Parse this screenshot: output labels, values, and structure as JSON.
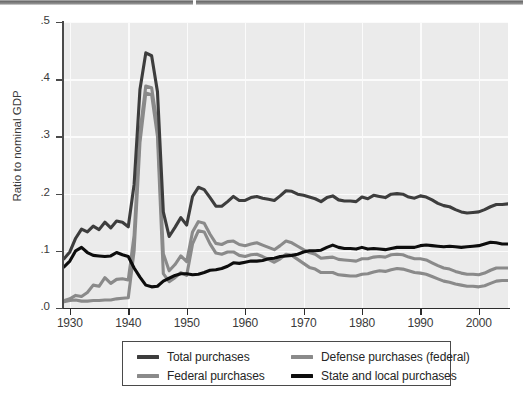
{
  "chart_data": {
    "type": "line",
    "title": "",
    "xlabel": "",
    "ylabel": "Ratio to nominal GDP",
    "xlim": [
      1929,
      2005
    ],
    "ylim": [
      0.0,
      0.5
    ],
    "grid": true,
    "legend_position": "below-plot",
    "xticklabels": [
      "1930",
      "1940",
      "1950",
      "1960",
      "1970",
      "1980",
      "1990",
      "2000"
    ],
    "xtickvalues": [
      1930,
      1940,
      1950,
      1960,
      1970,
      1980,
      1990,
      2000
    ],
    "yticklabels": [
      ".0",
      ".1",
      ".2",
      ".3",
      ".4",
      ".5"
    ],
    "ytickvalues": [
      0.0,
      0.1,
      0.2,
      0.3,
      0.4,
      0.5
    ],
    "x": [
      1929,
      1930,
      1931,
      1932,
      1933,
      1934,
      1935,
      1936,
      1937,
      1938,
      1939,
      1940,
      1941,
      1942,
      1943,
      1944,
      1945,
      1946,
      1947,
      1948,
      1949,
      1950,
      1951,
      1952,
      1953,
      1954,
      1955,
      1956,
      1957,
      1958,
      1959,
      1960,
      1961,
      1962,
      1963,
      1964,
      1965,
      1966,
      1967,
      1968,
      1969,
      1970,
      1971,
      1972,
      1973,
      1974,
      1975,
      1976,
      1977,
      1978,
      1979,
      1980,
      1981,
      1982,
      1983,
      1984,
      1985,
      1986,
      1987,
      1988,
      1989,
      1990,
      1991,
      1992,
      1993,
      1994,
      1995,
      1996,
      1997,
      1998,
      1999,
      2000,
      2001,
      2002,
      2003,
      2004,
      2005
    ],
    "series": [
      {
        "name": "Total purchases",
        "color": "#3d3d3d",
        "values": [
          0.086,
          0.098,
          0.122,
          0.138,
          0.133,
          0.143,
          0.137,
          0.15,
          0.14,
          0.152,
          0.15,
          0.142,
          0.216,
          0.382,
          0.446,
          0.441,
          0.378,
          0.168,
          0.125,
          0.141,
          0.158,
          0.145,
          0.195,
          0.211,
          0.207,
          0.193,
          0.178,
          0.178,
          0.186,
          0.195,
          0.188,
          0.188,
          0.193,
          0.195,
          0.192,
          0.19,
          0.188,
          0.196,
          0.205,
          0.204,
          0.199,
          0.197,
          0.194,
          0.191,
          0.186,
          0.193,
          0.196,
          0.189,
          0.187,
          0.187,
          0.186,
          0.194,
          0.191,
          0.197,
          0.195,
          0.193,
          0.199,
          0.2,
          0.199,
          0.194,
          0.192,
          0.196,
          0.194,
          0.189,
          0.183,
          0.179,
          0.177,
          0.172,
          0.168,
          0.166,
          0.167,
          0.168,
          0.172,
          0.177,
          0.181,
          0.181,
          0.182
        ]
      },
      {
        "name": "Federal purchases",
        "color": "#8a8a8a",
        "values": [
          0.013,
          0.016,
          0.022,
          0.02,
          0.027,
          0.04,
          0.038,
          0.053,
          0.043,
          0.05,
          0.051,
          0.049,
          0.127,
          0.308,
          0.388,
          0.385,
          0.318,
          0.095,
          0.065,
          0.076,
          0.091,
          0.081,
          0.133,
          0.151,
          0.148,
          0.129,
          0.113,
          0.111,
          0.116,
          0.117,
          0.111,
          0.109,
          0.112,
          0.114,
          0.11,
          0.106,
          0.102,
          0.109,
          0.117,
          0.114,
          0.108,
          0.102,
          0.097,
          0.094,
          0.087,
          0.088,
          0.089,
          0.085,
          0.084,
          0.083,
          0.082,
          0.086,
          0.086,
          0.089,
          0.09,
          0.089,
          0.093,
          0.094,
          0.093,
          0.089,
          0.086,
          0.086,
          0.084,
          0.079,
          0.074,
          0.07,
          0.068,
          0.064,
          0.061,
          0.059,
          0.059,
          0.058,
          0.061,
          0.066,
          0.07,
          0.07,
          0.07
        ]
      },
      {
        "name": "Defense purchases (federal)",
        "color": "#8a8a8a",
        "values": [
          0.011,
          0.013,
          0.014,
          0.012,
          0.012,
          0.013,
          0.013,
          0.014,
          0.014,
          0.016,
          0.017,
          0.018,
          0.1,
          0.289,
          0.376,
          0.373,
          0.3,
          0.06,
          0.046,
          0.053,
          0.062,
          0.057,
          0.112,
          0.135,
          0.133,
          0.112,
          0.096,
          0.094,
          0.098,
          0.098,
          0.092,
          0.09,
          0.093,
          0.094,
          0.09,
          0.085,
          0.08,
          0.086,
          0.094,
          0.092,
          0.085,
          0.078,
          0.071,
          0.068,
          0.062,
          0.062,
          0.062,
          0.058,
          0.057,
          0.056,
          0.056,
          0.059,
          0.06,
          0.063,
          0.065,
          0.064,
          0.067,
          0.069,
          0.068,
          0.065,
          0.062,
          0.061,
          0.059,
          0.055,
          0.051,
          0.047,
          0.045,
          0.042,
          0.04,
          0.038,
          0.038,
          0.037,
          0.039,
          0.043,
          0.047,
          0.048,
          0.048
        ]
      },
      {
        "name": "State and local purchases",
        "color": "#0d0d0d",
        "values": [
          0.072,
          0.082,
          0.1,
          0.106,
          0.097,
          0.092,
          0.091,
          0.09,
          0.091,
          0.097,
          0.093,
          0.09,
          0.07,
          0.054,
          0.04,
          0.037,
          0.038,
          0.047,
          0.052,
          0.057,
          0.06,
          0.06,
          0.058,
          0.059,
          0.062,
          0.066,
          0.067,
          0.069,
          0.073,
          0.079,
          0.078,
          0.08,
          0.082,
          0.082,
          0.083,
          0.086,
          0.087,
          0.09,
          0.091,
          0.092,
          0.094,
          0.098,
          0.1,
          0.1,
          0.101,
          0.106,
          0.11,
          0.106,
          0.104,
          0.104,
          0.103,
          0.106,
          0.103,
          0.104,
          0.103,
          0.102,
          0.104,
          0.106,
          0.106,
          0.106,
          0.106,
          0.109,
          0.11,
          0.109,
          0.108,
          0.107,
          0.108,
          0.107,
          0.106,
          0.107,
          0.108,
          0.109,
          0.112,
          0.115,
          0.114,
          0.112,
          0.112
        ]
      }
    ]
  },
  "axis": {
    "ylabel": "Ratio to nominal GDP"
  },
  "legend": {
    "entries": [
      {
        "label": "Total purchases",
        "color": "#3d3d3d"
      },
      {
        "label": "Defense purchases (federal)",
        "color": "#8a8a8a"
      },
      {
        "label": "Federal purchases",
        "color": "#8a8a8a"
      },
      {
        "label": "State and local purchases",
        "color": "#0d0d0d"
      }
    ]
  },
  "artifacts": {
    "bottom_text": " "
  }
}
